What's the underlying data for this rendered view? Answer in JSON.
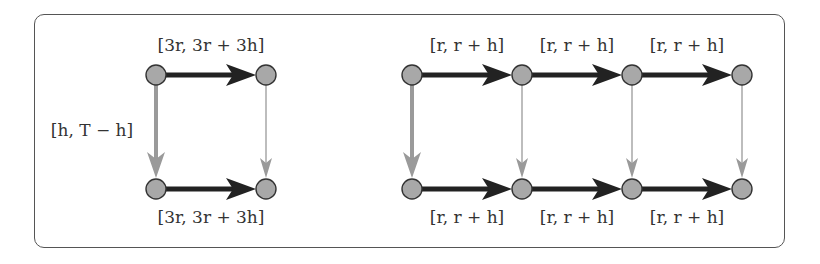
{
  "diagram": {
    "colors": {
      "node_fill": "#a8a8a8",
      "node_stroke": "#333333",
      "strong_edge": "#222222",
      "weak_edge": "#9a9a9a",
      "frame": "#555555"
    },
    "left": {
      "nodes": [
        {
          "id": "L1",
          "x": 156,
          "y": 75
        },
        {
          "id": "L2",
          "x": 266,
          "y": 75
        },
        {
          "id": "L3",
          "x": 156,
          "y": 189
        },
        {
          "id": "L4",
          "x": 266,
          "y": 189
        }
      ],
      "top_label": "[3r, 3r + 3h]",
      "bottom_label": "[3r, 3r + 3h]",
      "side_label": "[h, T − h]"
    },
    "right": {
      "nodes_top": [
        {
          "x": 412,
          "y": 75
        },
        {
          "x": 522,
          "y": 75
        },
        {
          "x": 632,
          "y": 75
        },
        {
          "x": 742,
          "y": 75
        }
      ],
      "nodes_bottom": [
        {
          "x": 412,
          "y": 189
        },
        {
          "x": 522,
          "y": 189
        },
        {
          "x": 632,
          "y": 189
        },
        {
          "x": 742,
          "y": 189
        }
      ],
      "top_labels": [
        "[r, r + h]",
        "[r, r + h]",
        "[r, r + h]"
      ],
      "bottom_labels": [
        "[r, r + h]",
        "[r, r + h]",
        "[r, r + h]"
      ]
    }
  }
}
